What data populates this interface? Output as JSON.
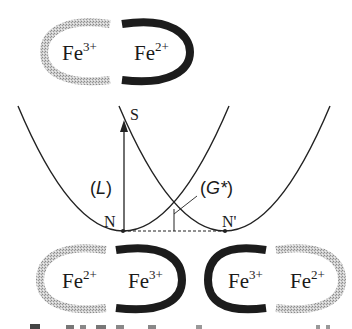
{
  "diagram": {
    "top_pair": {
      "left_ion": {
        "base": "Fe",
        "charge": "3+",
        "shell": "grey"
      },
      "right_ion": {
        "base": "Fe",
        "charge": "2+",
        "shell": "black"
      }
    },
    "potential_curves": {
      "labels": {
        "S": "S",
        "N": "N",
        "N_prime": "N'",
        "L": "L",
        "G": "G*",
        "open_paren": "(",
        "close_paren": ")"
      }
    },
    "bottom_left_pair": {
      "left_ion": {
        "base": "Fe",
        "charge": "2+",
        "shell": "grey"
      },
      "right_ion": {
        "base": "Fe",
        "charge": "3+",
        "shell": "black"
      }
    },
    "bottom_right_pair": {
      "left_ion": {
        "base": "Fe",
        "charge": "3+",
        "shell": "black"
      },
      "right_ion": {
        "base": "Fe",
        "charge": "2+",
        "shell": "grey"
      }
    },
    "colors": {
      "black_shell": "#1c1c1c",
      "grey_shell": "#b8b8b8",
      "line": "#222222"
    }
  }
}
